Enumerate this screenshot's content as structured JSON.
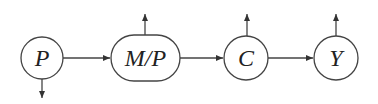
{
  "diagram": {
    "type": "flow",
    "nodes": [
      {
        "id": "P",
        "label": "P",
        "shape": "circle",
        "side_arrow": "down"
      },
      {
        "id": "MP",
        "label": "M/P",
        "shape": "pill",
        "side_arrow": "up"
      },
      {
        "id": "C",
        "label": "C",
        "shape": "circle",
        "side_arrow": "up"
      },
      {
        "id": "Y",
        "label": "Y",
        "shape": "circle",
        "side_arrow": "up"
      }
    ],
    "edges": [
      {
        "from": "P",
        "to": "MP"
      },
      {
        "from": "MP",
        "to": "C"
      },
      {
        "from": "C",
        "to": "Y"
      }
    ],
    "colors": {
      "line": "#444444",
      "text": "#222222",
      "background": "#ffffff"
    }
  }
}
